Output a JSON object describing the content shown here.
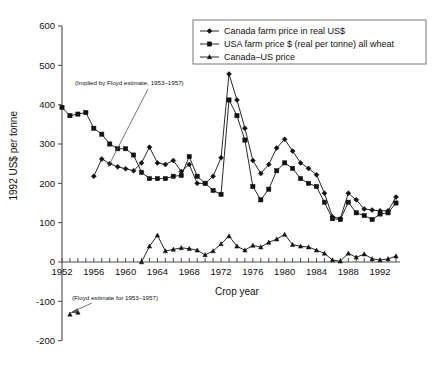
{
  "chart_data": {
    "type": "line",
    "title": "",
    "xlabel": "Crop year",
    "ylabel": "1992 US$ per tonne",
    "xlim": [
      1952,
      1994
    ],
    "ylim": [
      -200,
      600
    ],
    "ytick_labels": [
      "600",
      "500",
      "400",
      "300",
      "200",
      "100",
      "0",
      "-100",
      "-200"
    ],
    "ytick_values": [
      600,
      500,
      400,
      300,
      200,
      100,
      0,
      -100,
      -200
    ],
    "xtick_labels": [
      "1952",
      "1956",
      "1960",
      "1964",
      "1968",
      "1972",
      "1976",
      "1980",
      "1984",
      "1988",
      "1992"
    ],
    "xtick_values": [
      1952,
      1956,
      1960,
      1964,
      1968,
      1972,
      1976,
      1980,
      1984,
      1988,
      1992
    ],
    "grid": false,
    "legend_position": "top-right",
    "x": [
      1952,
      1953,
      1954,
      1955,
      1956,
      1957,
      1958,
      1959,
      1960,
      1961,
      1962,
      1963,
      1964,
      1965,
      1966,
      1967,
      1968,
      1969,
      1970,
      1971,
      1972,
      1973,
      1974,
      1975,
      1976,
      1977,
      1978,
      1979,
      1980,
      1981,
      1982,
      1983,
      1984,
      1985,
      1986,
      1987,
      1988,
      1989,
      1990,
      1991,
      1992,
      1993,
      1994
    ],
    "series": [
      {
        "name": "Canada farm price in real US$",
        "marker": "diamond",
        "x": [
          1956,
          1957,
          1958,
          1959,
          1960,
          1961,
          1962,
          1963,
          1964,
          1965,
          1966,
          1967,
          1968,
          1969,
          1970,
          1971,
          1972,
          1973,
          1974,
          1975,
          1976,
          1977,
          1978,
          1979,
          1980,
          1981,
          1982,
          1983,
          1984,
          1985,
          1986,
          1987,
          1988,
          1989,
          1990,
          1991,
          1992,
          1993,
          1994
        ],
        "values": [
          218,
          262,
          250,
          242,
          237,
          232,
          252,
          292,
          252,
          248,
          258,
          230,
          248,
          200,
          200,
          218,
          265,
          478,
          412,
          340,
          258,
          225,
          248,
          290,
          312,
          282,
          252,
          238,
          222,
          175,
          115,
          110,
          175,
          158,
          135,
          132,
          130,
          130,
          165
        ]
      },
      {
        "name": "USA farm price $ (real per tonne) all wheat",
        "marker": "square",
        "x": [
          1952,
          1953,
          1954,
          1955,
          1956,
          1957,
          1958,
          1959,
          1960,
          1961,
          1962,
          1963,
          1964,
          1965,
          1966,
          1967,
          1968,
          1969,
          1970,
          1971,
          1972,
          1973,
          1974,
          1975,
          1976,
          1977,
          1978,
          1979,
          1980,
          1981,
          1982,
          1983,
          1984,
          1985,
          1986,
          1987,
          1988,
          1989,
          1990,
          1991,
          1992,
          1993,
          1994
        ],
        "values": [
          393,
          372,
          376,
          380,
          340,
          325,
          300,
          288,
          288,
          272,
          228,
          212,
          212,
          212,
          218,
          220,
          268,
          218,
          200,
          182,
          172,
          412,
          372,
          310,
          192,
          158,
          185,
          232,
          252,
          238,
          212,
          200,
          192,
          152,
          110,
          108,
          152,
          125,
          118,
          108,
          122,
          125,
          150
        ]
      },
      {
        "name": "Canada–US price",
        "marker": "triangle",
        "x": [
          1962,
          1963,
          1964,
          1965,
          1966,
          1967,
          1968,
          1969,
          1970,
          1971,
          1972,
          1973,
          1974,
          1975,
          1976,
          1977,
          1978,
          1979,
          1980,
          1981,
          1982,
          1983,
          1984,
          1985,
          1986,
          1987,
          1988,
          1989,
          1990,
          1991,
          1992,
          1993,
          1994
        ],
        "values": [
          0,
          40,
          68,
          28,
          32,
          36,
          34,
          30,
          18,
          28,
          46,
          66,
          40,
          30,
          42,
          38,
          50,
          58,
          70,
          44,
          40,
          38,
          30,
          22,
          5,
          2,
          22,
          12,
          20,
          8,
          5,
          8,
          15
        ]
      }
    ],
    "annotations": [
      {
        "text": "(Implied by Floyd estimate, 1953–1957)",
        "anchor_year": 1957,
        "anchor_value": 230
      },
      {
        "text": "(Floyd estimate for 1953–1957)",
        "anchor_year": 1953,
        "anchor_value": -130
      }
    ],
    "floyd_points": {
      "x": [
        1953,
        1954
      ],
      "values": [
        -133,
        -128
      ],
      "marker": "triangle"
    }
  }
}
